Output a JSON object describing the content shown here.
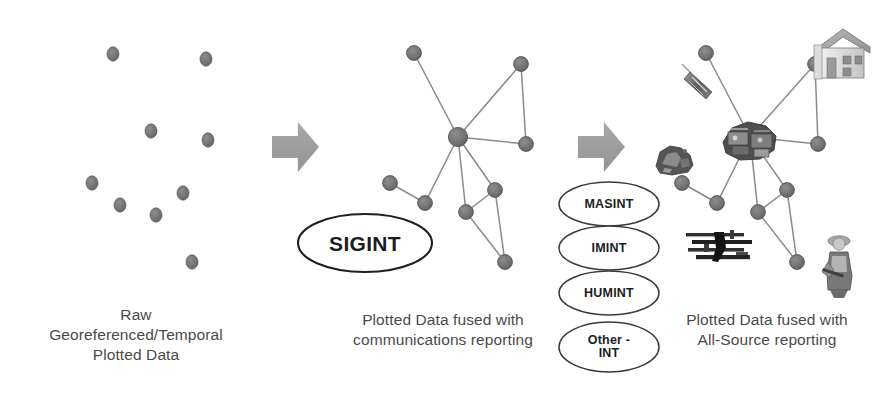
{
  "diagram": {
    "type": "process-flow",
    "background": "#ffffff",
    "node_color": "#6f6f6f",
    "edge_color": "#8a8a8a",
    "arrow_color": "#9a9a9a",
    "caption_color": "#4a4a4a"
  },
  "stages": [
    {
      "id": "raw",
      "caption": "Raw\nGeoreferenced/Temporal\nPlotted Data",
      "dots": [
        {
          "x": 113,
          "y": 54
        },
        {
          "x": 206,
          "y": 59
        },
        {
          "x": 151,
          "y": 131
        },
        {
          "x": 208,
          "y": 140
        },
        {
          "x": 92,
          "y": 183
        },
        {
          "x": 120,
          "y": 205
        },
        {
          "x": 156,
          "y": 215
        },
        {
          "x": 183,
          "y": 193
        },
        {
          "x": 192,
          "y": 262
        }
      ]
    },
    {
      "id": "sigint",
      "caption": "Plotted Data fused with\ncommunications reporting",
      "ellipse_label": "SIGINT",
      "nodes": [
        {
          "id": "n1",
          "x": 414,
          "y": 53
        },
        {
          "id": "n2",
          "x": 521,
          "y": 64
        },
        {
          "id": "hub",
          "x": 458,
          "y": 137
        },
        {
          "id": "n4",
          "x": 526,
          "y": 144
        },
        {
          "id": "n5",
          "x": 390,
          "y": 183
        },
        {
          "id": "n6",
          "x": 425,
          "y": 203
        },
        {
          "id": "n7",
          "x": 466,
          "y": 212
        },
        {
          "id": "n8",
          "x": 495,
          "y": 190
        },
        {
          "id": "n9",
          "x": 505,
          "y": 262
        }
      ],
      "edges": [
        [
          "n1",
          "hub"
        ],
        [
          "hub",
          "n2"
        ],
        [
          "n2",
          "n4"
        ],
        [
          "hub",
          "n4"
        ],
        [
          "hub",
          "n6"
        ],
        [
          "hub",
          "n7"
        ],
        [
          "hub",
          "n8"
        ],
        [
          "n5",
          "n6"
        ],
        [
          "n7",
          "n8"
        ],
        [
          "n7",
          "n9"
        ],
        [
          "n8",
          "n9"
        ]
      ]
    },
    {
      "id": "allsource",
      "caption": "Plotted Data fused with\nAll-Source reporting",
      "ellipse_labels": [
        "MASINT",
        "IMINT",
        "HUMINT",
        "Other -\nINT"
      ],
      "nodes": [
        {
          "id": "m1",
          "x": 706,
          "y": 53
        },
        {
          "id": "m2",
          "x": 815,
          "y": 64
        },
        {
          "id": "hub",
          "x": 750,
          "y": 137
        },
        {
          "id": "m4",
          "x": 818,
          "y": 144
        },
        {
          "id": "m5",
          "x": 682,
          "y": 183
        },
        {
          "id": "m6",
          "x": 717,
          "y": 203
        },
        {
          "id": "m7",
          "x": 758,
          "y": 212
        },
        {
          "id": "m8",
          "x": 787,
          "y": 190
        },
        {
          "id": "m9",
          "x": 797,
          "y": 262
        }
      ],
      "edges": [
        [
          "m1",
          "hub"
        ],
        [
          "hub",
          "m2"
        ],
        [
          "m2",
          "m4"
        ],
        [
          "hub",
          "m4"
        ],
        [
          "hub",
          "m6"
        ],
        [
          "hub",
          "m7"
        ],
        [
          "hub",
          "m8"
        ],
        [
          "m5",
          "m6"
        ],
        [
          "m7",
          "m8"
        ],
        [
          "m7",
          "m9"
        ],
        [
          "m8",
          "m9"
        ]
      ],
      "imagery": [
        {
          "name": "building-photo-icon",
          "x": 812,
          "y": 27,
          "w": 62,
          "h": 52
        },
        {
          "name": "signal-device-photo-icon",
          "x": 678,
          "y": 62,
          "w": 48,
          "h": 38
        },
        {
          "name": "rubble-photo-icon",
          "x": 650,
          "y": 138,
          "w": 48,
          "h": 38
        },
        {
          "name": "vehicle-cluster-photo-icon",
          "x": 718,
          "y": 112,
          "w": 62,
          "h": 52
        },
        {
          "name": "weapons-photo-icon",
          "x": 684,
          "y": 228,
          "w": 72,
          "h": 40
        },
        {
          "name": "person-photo-icon",
          "x": 820,
          "y": 232,
          "w": 40,
          "h": 66
        }
      ]
    }
  ],
  "arrows": [
    {
      "name": "arrow-raw-to-sigint",
      "x": 272,
      "y": 122,
      "w": 47,
      "h": 50
    },
    {
      "name": "arrow-sigint-to-allsource",
      "x": 578,
      "y": 122,
      "w": 47,
      "h": 50
    }
  ],
  "int_ellipses": [
    {
      "label": "MASINT",
      "cx": 609,
      "cy": 204,
      "rx": 50,
      "ry": 22
    },
    {
      "label": "IMINT",
      "cx": 609,
      "cy": 248,
      "rx": 50,
      "ry": 22
    },
    {
      "label": "HUMINT",
      "cx": 609,
      "cy": 293,
      "rx": 50,
      "ry": 22
    },
    {
      "label": "Other -\nINT",
      "cx": 609,
      "cy": 347,
      "rx": 50,
      "ry": 25
    }
  ],
  "sigint_ellipse": {
    "cx": 365,
    "cy": 243,
    "rx": 67,
    "ry": 29
  }
}
